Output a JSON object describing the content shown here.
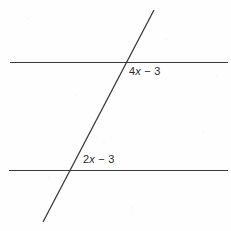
{
  "figure": {
    "name": "parallel-lines-transversal-diagram",
    "background_color": "#fefefe",
    "line_color": "#3a3a3a",
    "text_color": "#2b2b2b",
    "width": 231,
    "height": 231
  },
  "lines": {
    "upper_parallel": {
      "name": "upper-parallel-line",
      "x1": 10,
      "y1": 62.5,
      "x2": 228,
      "y2": 62.5,
      "stroke_width": 1.2
    },
    "lower_parallel": {
      "name": "lower-parallel-line",
      "x1": 9,
      "y1": 170.5,
      "x2": 228,
      "y2": 170.5,
      "stroke_width": 1.2
    },
    "transversal": {
      "name": "transversal-line",
      "x1": 154,
      "y1": 10,
      "x2": 43,
      "y2": 222,
      "stroke_width": 1.3
    }
  },
  "intersections": {
    "upper": {
      "x": 126,
      "y": 62
    },
    "lower": {
      "x": 71,
      "y": 170
    }
  },
  "labels": {
    "upper_angle": {
      "coefficient": "4",
      "variable": "x",
      "operator": " − ",
      "constant": "3",
      "full_text": "4x − 3"
    },
    "lower_angle": {
      "coefficient": "2",
      "variable": "x",
      "operator": " − ",
      "constant": "3",
      "full_text": "2x − 3"
    }
  }
}
